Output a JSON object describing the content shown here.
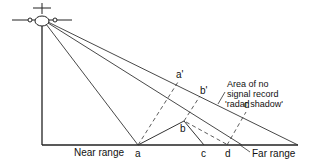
{
  "diagram": {
    "labels": {
      "near_range": "Near range",
      "far_range": "Far range",
      "a": "a",
      "b": "b",
      "c": "c",
      "d": "d",
      "a_prime": "a'",
      "b_prime": "b'",
      "d_upper": "d",
      "shadow_line1": "Area of no",
      "shadow_line2": "signal record",
      "shadow_line3": "'radar shadow'"
    },
    "colors": {
      "line": "#333333",
      "background": "#ffffff"
    }
  }
}
